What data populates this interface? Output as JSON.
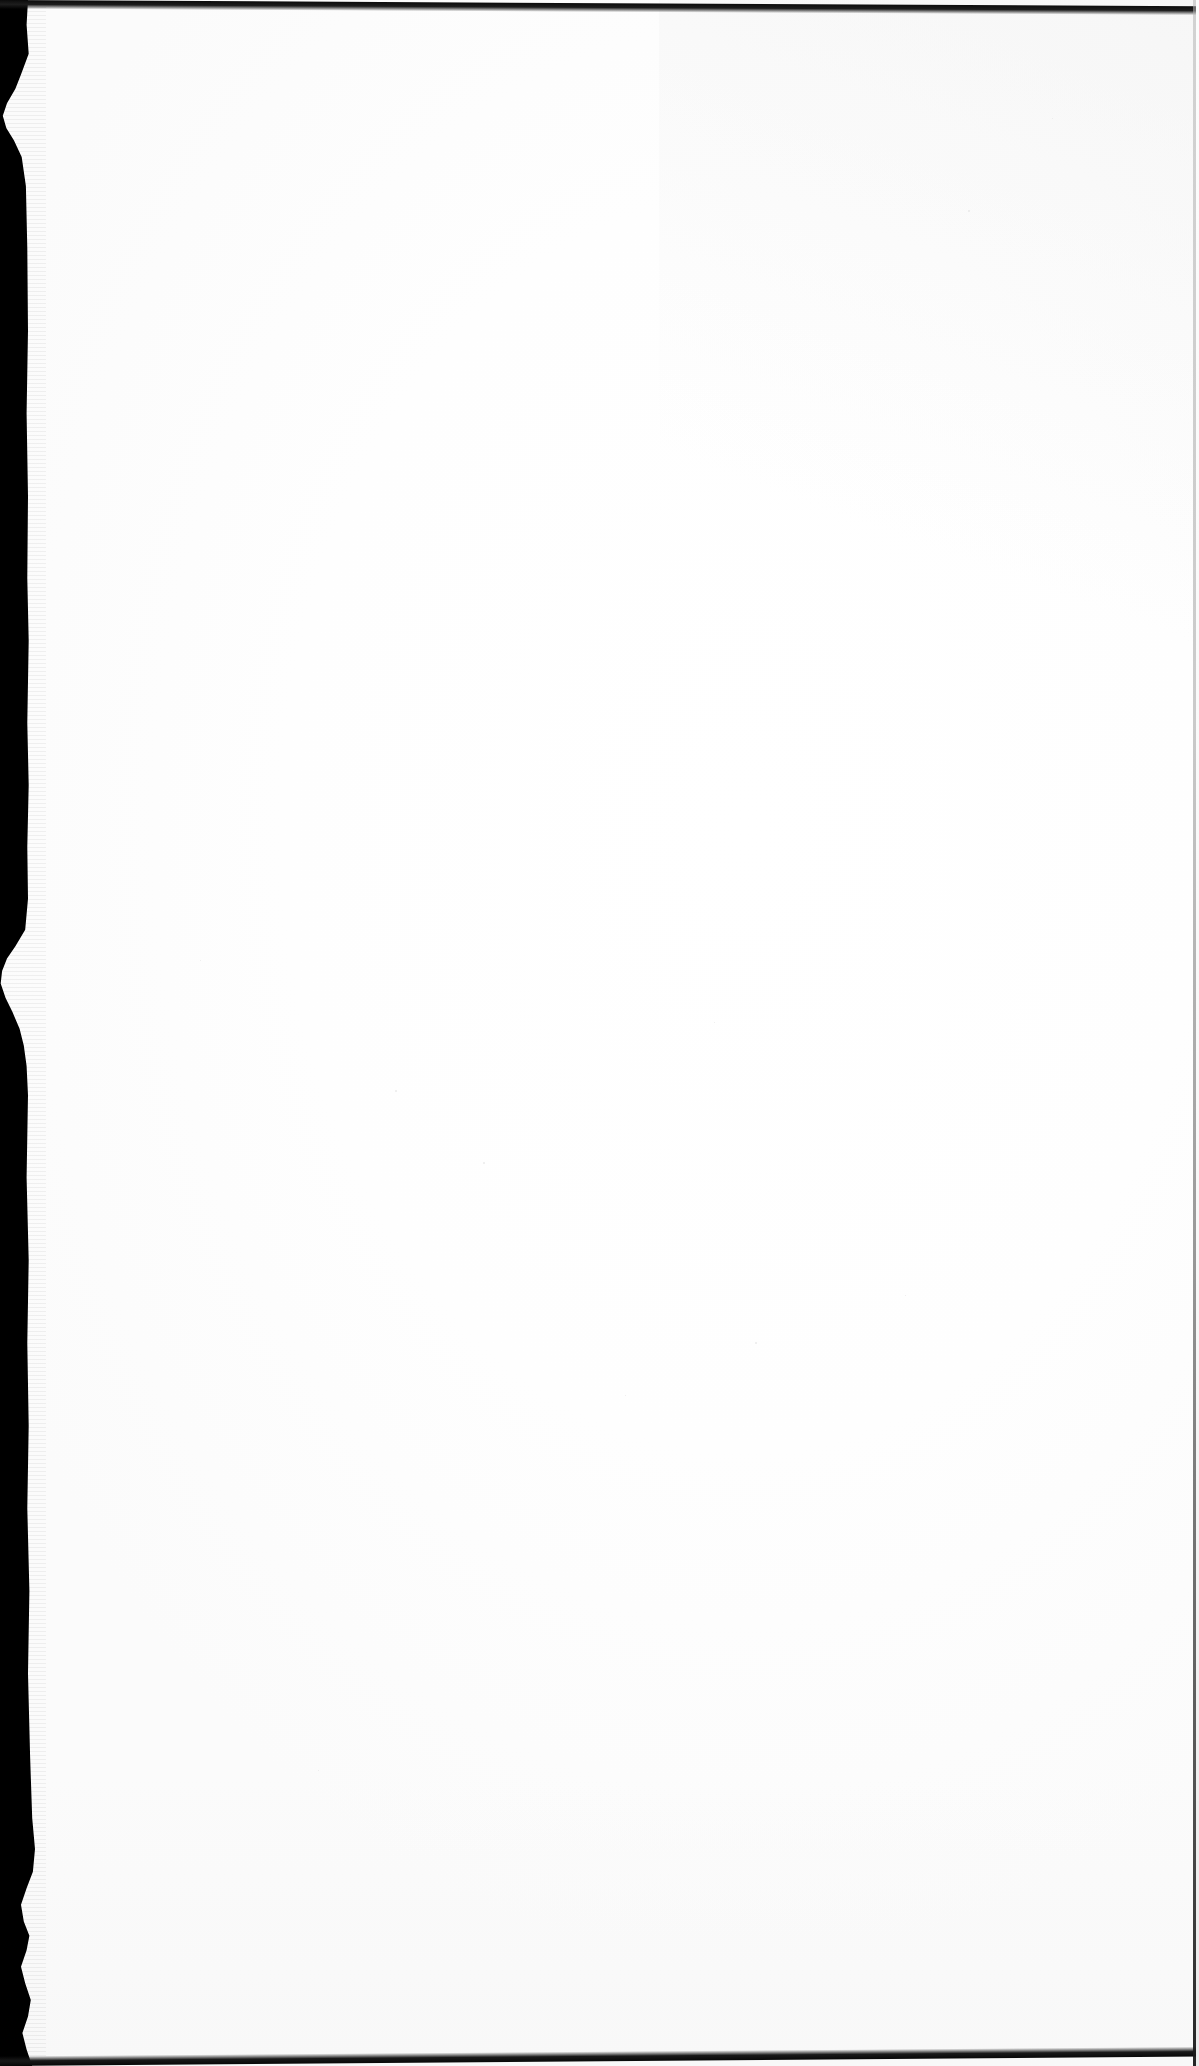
{
  "document": {
    "type": "scanned-page",
    "page_content_text": "",
    "page_number_text": "",
    "is_blank": true,
    "width_px": 1199,
    "height_px": 2066
  },
  "page": {
    "surface_label": "blank-paper-surface",
    "body_text": "",
    "paper_color": "#fdfdfd",
    "paper_shadow_color": "#f4f4f4"
  },
  "gutter": {
    "label": "scanner-gutter-shadow",
    "side": "left",
    "color": "#000000",
    "notch_count": 2
  },
  "edges": {
    "top_label": "top-edge-line",
    "bottom_label": "bottom-edge-line",
    "right_label": "right-edge-line",
    "top_color": "#141414",
    "bottom_color": "#101010",
    "right_color": "#6e6e6e"
  },
  "artifacts": {
    "label": "scan-speckles",
    "specks": [
      {
        "x": 395,
        "y": 1090,
        "size": 2
      },
      {
        "x": 483,
        "y": 1162,
        "size": 2
      },
      {
        "x": 755,
        "y": 1342,
        "size": 2
      },
      {
        "x": 625,
        "y": 1395,
        "size": 1
      },
      {
        "x": 200,
        "y": 960,
        "size": 1
      },
      {
        "x": 968,
        "y": 210,
        "size": 2
      },
      {
        "x": 1052,
        "y": 118,
        "size": 1
      },
      {
        "x": 714,
        "y": 1022,
        "size": 1
      },
      {
        "x": 905,
        "y": 1295,
        "size": 1
      },
      {
        "x": 318,
        "y": 1770,
        "size": 1
      }
    ]
  }
}
